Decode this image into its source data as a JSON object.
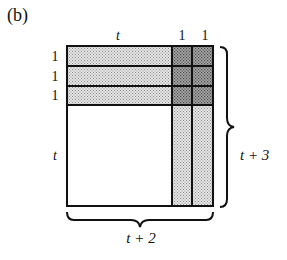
{
  "figure": {
    "panel_label": "(b)",
    "top_labels": [
      "t",
      "1",
      "1"
    ],
    "left_labels": [
      "1",
      "1",
      "1",
      "t"
    ],
    "right_brace_label": "t + 3",
    "bottom_brace_label": "t + 2",
    "colors": {
      "light_shade": "#c8c8c8",
      "dark_shade": "#8a8a8a",
      "unshaded": "#ffffff",
      "lines": "#111111"
    },
    "regions": [
      {
        "name": "top-rows-strip",
        "shade": "light",
        "description": "three rows of height 1 across width t"
      },
      {
        "name": "right-columns-strip",
        "shade": "light",
        "description": "two columns of width 1 across height t"
      },
      {
        "name": "overlap-corner",
        "shade": "dark",
        "description": "3 x 2 overlap of rows and columns"
      },
      {
        "name": "main-square",
        "shade": "none",
        "description": "t x t unshaded square"
      }
    ]
  }
}
